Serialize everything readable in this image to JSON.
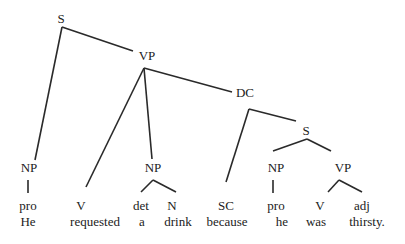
{
  "diagram": {
    "type": "syntax-tree",
    "sentence": "He requested a drink because he was thirsty.",
    "nodes": [
      {
        "id": "S1",
        "label": "S"
      },
      {
        "id": "VP1",
        "label": "VP"
      },
      {
        "id": "DC",
        "label": "DC"
      },
      {
        "id": "S2",
        "label": "S"
      },
      {
        "id": "NP1",
        "label": "NP"
      },
      {
        "id": "V1",
        "label": "V"
      },
      {
        "id": "NP2",
        "label": "NP"
      },
      {
        "id": "SC",
        "label": "SC"
      },
      {
        "id": "NP3",
        "label": "NP"
      },
      {
        "id": "VP2",
        "label": "VP"
      },
      {
        "id": "pro1",
        "label": "pro"
      },
      {
        "id": "det",
        "label": "det"
      },
      {
        "id": "N",
        "label": "N"
      },
      {
        "id": "pro2",
        "label": "pro"
      },
      {
        "id": "V2",
        "label": "V"
      },
      {
        "id": "adj",
        "label": "adj"
      }
    ],
    "edges": [
      [
        "S1",
        "NP1"
      ],
      [
        "S1",
        "VP1"
      ],
      [
        "VP1",
        "V1"
      ],
      [
        "VP1",
        "NP2"
      ],
      [
        "VP1",
        "DC"
      ],
      [
        "DC",
        "SC"
      ],
      [
        "DC",
        "S2"
      ],
      [
        "S2",
        "NP3"
      ],
      [
        "S2",
        "VP2"
      ],
      [
        "NP1",
        "pro1"
      ],
      [
        "NP2",
        "det"
      ],
      [
        "NP2",
        "N"
      ],
      [
        "NP3",
        "pro2"
      ],
      [
        "VP2",
        "V2"
      ],
      [
        "VP2",
        "adj"
      ]
    ],
    "words": [
      {
        "id": "w-he",
        "text": "He",
        "tag": "pro1"
      },
      {
        "id": "w-requested",
        "text": "requested",
        "tag": "V1"
      },
      {
        "id": "w-a",
        "text": "a",
        "tag": "det"
      },
      {
        "id": "w-drink",
        "text": "drink",
        "tag": "N"
      },
      {
        "id": "w-because",
        "text": "because",
        "tag": "SC"
      },
      {
        "id": "w-he2",
        "text": "he",
        "tag": "pro2"
      },
      {
        "id": "w-was",
        "text": "was",
        "tag": "V2"
      },
      {
        "id": "w-thirsty",
        "text": "thirsty.",
        "tag": "adj"
      }
    ]
  }
}
